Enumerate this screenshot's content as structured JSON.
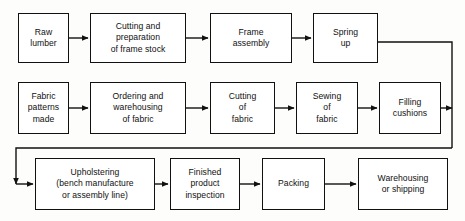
{
  "diagram": {
    "type": "process-flowchart",
    "orientation": "serpentine-left-to-right",
    "canvas": {
      "width": 465,
      "height": 221
    },
    "style": {
      "background_color": "#fdfdfc",
      "box_fill": "#ffffff",
      "line_color": "#111111",
      "text_color": "#101010"
    },
    "rows": [
      {
        "name": "frame-line",
        "nodes": [
          {
            "id": "raw-lumber",
            "label": "Raw\nlumber",
            "x": 18,
            "y": 13,
            "w": 51,
            "h": 50
          },
          {
            "id": "cutting-frame-stock",
            "label": "Cutting and\npreparation\nof frame stock",
            "x": 90,
            "y": 13,
            "w": 96,
            "h": 50
          },
          {
            "id": "frame-assembly",
            "label": "Frame\nassembly",
            "x": 210,
            "y": 13,
            "w": 82,
            "h": 50
          },
          {
            "id": "spring-up",
            "label": "Spring\nup",
            "x": 313,
            "y": 13,
            "w": 65,
            "h": 50
          }
        ]
      },
      {
        "name": "fabric-line",
        "nodes": [
          {
            "id": "fabric-patterns-made",
            "label": "Fabric\npatterns\nmade",
            "x": 18,
            "y": 82,
            "w": 51,
            "h": 52
          },
          {
            "id": "ordering-warehousing-fabric",
            "label": "Ordering and\nwarehousing\nof fabric",
            "x": 90,
            "y": 82,
            "w": 96,
            "h": 52
          },
          {
            "id": "cutting-of-fabric",
            "label": "Cutting\nof\nfabric",
            "x": 210,
            "y": 82,
            "w": 65,
            "h": 52
          },
          {
            "id": "sewing-of-fabric",
            "label": "Sewing\nof\nfabric",
            "x": 296,
            "y": 82,
            "w": 62,
            "h": 52
          },
          {
            "id": "filling-cushions",
            "label": "Filling\ncushions",
            "x": 379,
            "y": 82,
            "w": 62,
            "h": 52
          }
        ]
      },
      {
        "name": "assembly-finishing-line",
        "nodes": [
          {
            "id": "upholstering",
            "label": "Upholstering\n(bench manufacture\nor assembly line)",
            "x": 35,
            "y": 158,
            "w": 120,
            "h": 52
          },
          {
            "id": "finished-product-inspection",
            "label": "Finished\nproduct\ninspection",
            "x": 170,
            "y": 158,
            "w": 70,
            "h": 52
          },
          {
            "id": "packing",
            "label": "Packing",
            "x": 262,
            "y": 158,
            "w": 63,
            "h": 52
          },
          {
            "id": "warehousing-or-shipping",
            "label": "Warehousing\nor shipping",
            "x": 358,
            "y": 158,
            "w": 90,
            "h": 52
          }
        ]
      }
    ],
    "connectors": [
      {
        "id": "raw-lumber-to-cutting",
        "from": "raw-lumber",
        "to": "cutting-frame-stock",
        "kind": "arrow-right"
      },
      {
        "id": "cutting-to-frame-assembly",
        "from": "cutting-frame-stock",
        "to": "frame-assembly",
        "kind": "arrow-right"
      },
      {
        "id": "frame-assembly-to-spring-up",
        "from": "frame-assembly",
        "to": "spring-up",
        "kind": "arrow-right"
      },
      {
        "id": "spring-up-to-trunk",
        "from": "spring-up",
        "to": "right-trunk",
        "kind": "elbow-right-down"
      },
      {
        "id": "fabric-patterns-to-ordering",
        "from": "fabric-patterns-made",
        "to": "ordering-warehousing-fabric",
        "kind": "arrow-right"
      },
      {
        "id": "ordering-to-cutting-fabric",
        "from": "ordering-warehousing-fabric",
        "to": "cutting-of-fabric",
        "kind": "arrow-right"
      },
      {
        "id": "cutting-fabric-to-sewing",
        "from": "cutting-of-fabric",
        "to": "sewing-of-fabric",
        "kind": "arrow-right"
      },
      {
        "id": "sewing-to-filling-cushions",
        "from": "sewing-of-fabric",
        "to": "filling-cushions",
        "kind": "arrow-right"
      },
      {
        "id": "filling-cushions-to-trunk",
        "from": "filling-cushions",
        "to": "right-trunk",
        "kind": "arrow-right"
      },
      {
        "id": "trunk-to-upholstering",
        "from": "right-trunk",
        "to": "upholstering",
        "kind": "return-bus-left-arrow"
      },
      {
        "id": "upholstering-to-inspection",
        "from": "upholstering",
        "to": "finished-product-inspection",
        "kind": "arrow-right"
      },
      {
        "id": "inspection-to-packing",
        "from": "finished-product-inspection",
        "to": "packing",
        "kind": "arrow-right"
      },
      {
        "id": "packing-to-warehousing",
        "from": "packing",
        "to": "warehousing-or-shipping",
        "kind": "arrow-right"
      }
    ]
  }
}
